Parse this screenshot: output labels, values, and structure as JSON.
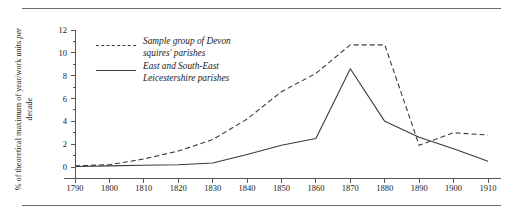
{
  "figure": {
    "has_top_rule": true,
    "has_bottom_rule": true
  },
  "chart_data": {
    "type": "line",
    "title": "",
    "subtitle": "",
    "xlabel": "",
    "ylabel": "% of theoretical maximum of year/work units per decade",
    "ylabel_italic_word": "per",
    "x": [
      1790,
      1800,
      1810,
      1820,
      1830,
      1840,
      1850,
      1860,
      1870,
      1880,
      1890,
      1900,
      1910
    ],
    "xlim": [
      1790,
      1910
    ],
    "ylim": [
      0,
      12
    ],
    "xticks": [
      1790,
      1800,
      1810,
      1820,
      1830,
      1840,
      1850,
      1860,
      1870,
      1880,
      1890,
      1900,
      1910
    ],
    "xtick_labels": [
      "1790",
      "1800",
      "1810",
      "1820",
      "1830",
      "1840",
      "1850",
      "1860",
      "1870",
      "1880",
      "1890",
      "1900",
      "1910"
    ],
    "yticks": [
      0,
      2,
      4,
      6,
      8,
      10,
      12
    ],
    "ytick_labels": [
      "0",
      "2",
      "4",
      "6",
      "8",
      "10",
      "12"
    ],
    "y_minor_ticks": [
      1,
      3,
      5,
      7,
      9,
      11
    ],
    "grid": false,
    "legend_position": "upper-left-inside",
    "series": [
      {
        "name": "Sample group of Devon squires' parishes",
        "style": "dashed",
        "color": "#3a3a3a",
        "values": [
          0.1,
          0.2,
          0.7,
          1.4,
          2.4,
          4.2,
          6.6,
          8.2,
          10.7,
          10.7,
          1.9,
          3.0,
          2.8
        ]
      },
      {
        "name": "East and South-East Leicestershire parishes",
        "style": "solid",
        "color": "#3a3a3a",
        "values": [
          0.05,
          0.1,
          0.15,
          0.2,
          0.35,
          1.1,
          1.9,
          2.5,
          8.6,
          4.0,
          2.6,
          1.6,
          0.5
        ]
      }
    ]
  },
  "legend": {
    "entries": [
      {
        "label": "Sample group of Devon\nsquires' parishes",
        "style": "dashed"
      },
      {
        "label": "East and South-East\nLeicestershire parishes",
        "style": "solid"
      }
    ]
  }
}
